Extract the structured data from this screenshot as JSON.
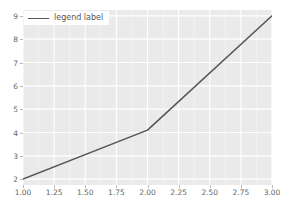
{
  "chart_data": {
    "type": "line",
    "title": "",
    "xlabel": "",
    "ylabel": "",
    "x": [
      1.0,
      2.0,
      3.0
    ],
    "values": [
      2.0,
      4.1,
      9.0
    ],
    "series": [
      {
        "name": "legend label",
        "x": [
          1.0,
          2.0,
          3.0
        ],
        "values": [
          2.0,
          4.1,
          9.0
        ]
      }
    ],
    "xlim": [
      1.0,
      3.0
    ],
    "ylim": [
      1.75,
      9.25
    ],
    "xticks": [
      1.0,
      1.25,
      1.5,
      1.75,
      2.0,
      2.25,
      2.5,
      2.75,
      3.0
    ],
    "xtick_labels": [
      "1.00",
      "1.25",
      "1.50",
      "1.75",
      "2.00",
      "2.25",
      "2.50",
      "2.75",
      "3.00"
    ],
    "yticks": [
      2,
      3,
      4,
      5,
      6,
      7,
      8,
      9
    ],
    "ytick_labels": [
      "2",
      "3",
      "4",
      "5",
      "6",
      "7",
      "8",
      "9"
    ],
    "grid": true,
    "legend": {
      "position": "upper left",
      "entries": [
        {
          "label": "legend label",
          "color": "#555555",
          "style": "solid"
        }
      ]
    },
    "colors": {
      "line": "#555555",
      "axes_background": "#eaeaea",
      "figure_background": "#ffffff",
      "gridline": "#ffffff",
      "tick_label": "#666666"
    }
  }
}
